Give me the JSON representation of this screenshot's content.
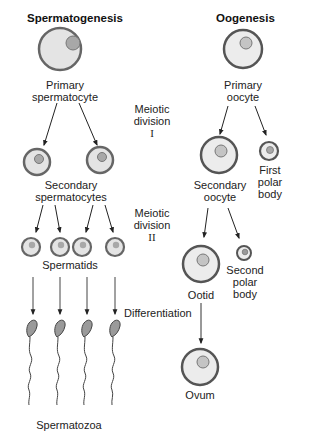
{
  "diagram": {
    "titles": {
      "left": "Spermatogenesis",
      "right": "Oogenesis"
    },
    "spermatogenesis": {
      "primary": "Primary",
      "primary2": "spermatocyte",
      "secondary": "Secondary",
      "secondary2": "spermatocytes",
      "spermatids": "Spermatids",
      "spermatozoa": "Spermatozoa"
    },
    "oogenesis": {
      "primary": "Primary",
      "primary2": "oocyte",
      "secondary": "Secondary",
      "secondary2": "oocyte",
      "first_polar1": "First",
      "first_polar2": "polar",
      "first_polar3": "body",
      "second_polar1": "Second",
      "second_polar2": "polar",
      "second_polar3": "body",
      "ootid": "Ootid",
      "ovum": "Ovum"
    },
    "stages": {
      "meiosis1_a": "Meiotic",
      "meiosis1_b": "division",
      "meiosis1_c": "I",
      "meiosis2_a": "Meiotic",
      "meiosis2_b": "division",
      "meiosis2_c": "II",
      "differentiation": "Differentiation"
    },
    "colors": {
      "cell_fill": "#e4e4e4",
      "cell_outline": "#555555",
      "nucleus_fill": "#a8a8a8",
      "sperm_head": "#9a9a9a",
      "arrow": "#222222"
    }
  }
}
